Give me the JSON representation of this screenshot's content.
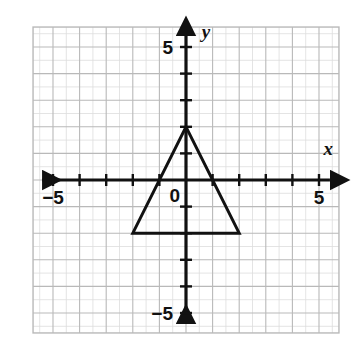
{
  "chart_data": {
    "type": "scatter",
    "title": "",
    "subtitle": "",
    "xlabel": "x",
    "ylabel": "y",
    "xlim": [
      -5.75,
      5.75
    ],
    "ylim": [
      -5.75,
      5.75
    ],
    "grid": true,
    "grid_major_step": 1,
    "legend": "none",
    "axis_tick_step": 1,
    "x_tick_labels": [
      {
        "value": -5,
        "text": "−5"
      },
      {
        "value": 5,
        "text": "5"
      }
    ],
    "y_tick_labels": [
      {
        "value": 5,
        "text": "5"
      },
      {
        "value": -5,
        "text": "−5"
      }
    ],
    "origin_label": "0",
    "annotations": [
      {
        "name": "x-axis-letter",
        "text": "x",
        "x": 5.35,
        "y": 0.95
      },
      {
        "name": "y-axis-letter",
        "text": "y",
        "x": 0.75,
        "y": 5.35
      }
    ],
    "shapes": [
      {
        "name": "triangle",
        "type": "polygon",
        "closed": true,
        "stroke": "#111111",
        "stroke_width": 3,
        "fill": "none",
        "vertices": [
          {
            "label": "apex",
            "x": 0,
            "y": 2
          },
          {
            "label": "bottom-right",
            "x": 2,
            "y": -2
          },
          {
            "label": "bottom-left",
            "x": -2,
            "y": -2
          }
        ]
      }
    ]
  },
  "style": {
    "grid_line_color": "#b9b9b9",
    "grid_fine_color": "#dddddd",
    "axis_color": "#111111",
    "plot_background": "#ffffff",
    "page_background": "#ffffff",
    "border_color": "#b9b9b9"
  }
}
